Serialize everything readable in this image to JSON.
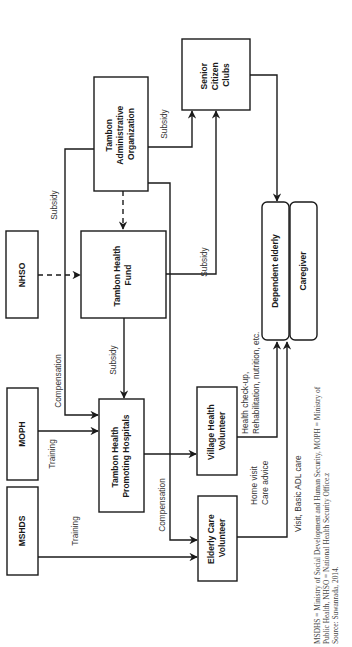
{
  "nodes": {
    "tao": {
      "line1": "Tambon",
      "line2": "Administrative",
      "line3": "Organization"
    },
    "scc": {
      "line1": "Senior",
      "line2": "Citizen",
      "line3": "Clubs"
    },
    "nhso": {
      "label": "NHSO"
    },
    "thf": {
      "line1": "Tambon Health",
      "line2": "Fund"
    },
    "moph": {
      "label": "MOPH"
    },
    "thph": {
      "line1": "Tambon Health",
      "line2": "Promoting Hospitals"
    },
    "vhv": {
      "line1": "Village Health",
      "line2": "Volunteer"
    },
    "mshds": {
      "label": "MSHDS"
    },
    "ecv": {
      "line1": "Elderly Care",
      "line2": "Volunteer"
    },
    "dependent": {
      "label": "Dependent elderly"
    },
    "caregiver": {
      "label": "Caregiver"
    }
  },
  "edges": {
    "tao_to_thph": "Subsidy",
    "tao_to_scc": "Subsidy",
    "thf_to_scc": "Subsidy",
    "thf_to_thph": "Subsidy",
    "nhso_to_thph": "Compensation",
    "moph_to_thph": "Training",
    "mshds_to_ecv": "Training",
    "thph_to_ecv": "Compensation",
    "vhv_to_dependent_line1": "Health check-up,",
    "vhv_to_dependent_line2": "Rehabilitation, nutrition, etc.",
    "vhv_home_line1": "Home visit",
    "vhv_home_line2": "Care advice",
    "ecv_to_dependent": "Visit, Basic ADL care"
  },
  "footnote": {
    "line1": "MSDHS = Ministry of Social Development and Human Security, MOPH = Ministry of",
    "line2": "Public Health, NHSO = National Health Security Office.z",
    "line3": "Source: Suwanrada, 2014."
  }
}
